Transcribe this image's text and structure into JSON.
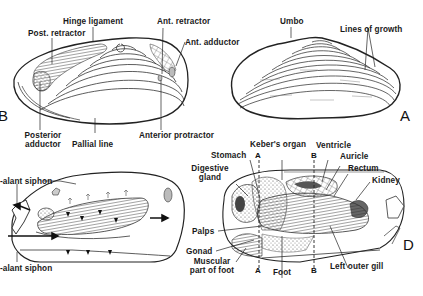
{
  "figure": {
    "panels": [
      {
        "id": "A",
        "letter": "A",
        "description": "External view of clam shell (left valve)",
        "labels": [
          "Umbo",
          "Lines of growth"
        ]
      },
      {
        "id": "B",
        "letter": "B",
        "description": "Inner surface of shell valve showing muscle scars",
        "labels": [
          "Hinge ligament",
          "Post. retractor",
          "Ant. retractor",
          "Ant. adductor",
          "Posterior adductor",
          "Pallial line",
          "Anterior protractor"
        ]
      },
      {
        "id": "C",
        "letter": "",
        "description": "Water flow through mantle cavity",
        "labels": [
          "Excurrent (exhalant) siphon",
          "Incurrent (inhalant) siphon"
        ]
      },
      {
        "id": "D",
        "letter": "D",
        "description": "Internal anatomy, lateral view",
        "labels": [
          "Stomach",
          "Keber's organ",
          "Ventricle",
          "Auricle",
          "Rectum",
          "Kidney",
          "Digestive gland",
          "Palps",
          "Gonad",
          "Muscular part of foot",
          "Foot",
          "Left outer gill"
        ]
      }
    ],
    "labels": {
      "hinge_ligament": "Hinge ligament",
      "post_retractor": "Post. retractor",
      "ant_retractor": "Ant. retractor",
      "ant_adductor": "Ant. adductor",
      "posterior": "Posterior",
      "adductor": "adductor",
      "pallial_line": "Pallial line",
      "anterior_protractor": "Anterior protractor",
      "umbo": "Umbo",
      "lines_of_growth": "Lines of growth",
      "exhalant_siphon": "-alant siphon",
      "inhalant_siphon": "-alant siphon",
      "stomach": "Stomach",
      "kebers_organ": "Keber's organ",
      "ventricle": "Ventricle",
      "auricle": "Auricle",
      "rectum": "Rectum",
      "kidney": "Kidney",
      "digestive": "Digestive",
      "gland": "gland",
      "palps": "Palps",
      "gonad": "Gonad",
      "muscular": "Muscular",
      "part_of_foot": "part of foot",
      "foot": "Foot",
      "left_outer_gill": "Left outer gill",
      "section_a_top": "A",
      "section_a_bottom": "A",
      "section_b_top": "B",
      "section_b_bottom": "B"
    },
    "panel_letters": {
      "a": "A",
      "b": "B",
      "d": "D"
    }
  }
}
